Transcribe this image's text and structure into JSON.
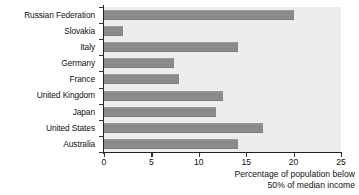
{
  "chart_data": {
    "type": "bar",
    "orientation": "horizontal",
    "title": "",
    "subtitle": "",
    "xlabel": "Percentage of population below 50% of median income",
    "ylabel": "",
    "xlim": [
      0,
      25
    ],
    "xticks": [
      0,
      5,
      10,
      15,
      20,
      25
    ],
    "xtick_labels": [
      "0",
      "5",
      "10",
      "15",
      "20",
      "25"
    ],
    "grid": false,
    "legend": null,
    "categories": [
      "Russian Federation",
      "Slovakia",
      "Italy",
      "Germany",
      "France",
      "United Kingdom",
      "Japan",
      "United States",
      "Australia"
    ],
    "values": [
      20.0,
      2.0,
      14.1,
      7.4,
      7.9,
      12.6,
      11.8,
      16.8,
      14.1
    ],
    "series": [
      {
        "name": "Percentage of population below 50% of median income",
        "values": [
          20.0,
          2.0,
          14.1,
          7.4,
          7.9,
          12.6,
          11.8,
          16.8,
          14.1
        ]
      }
    ],
    "colors": {
      "bar": "#8b8b8b",
      "plot_background": "#ededed",
      "figure_background": "#ffffff",
      "axis": "#222222",
      "text": "#111111"
    }
  },
  "axis_title_lines": [
    "Percentage of population below",
    "50% of median income"
  ]
}
